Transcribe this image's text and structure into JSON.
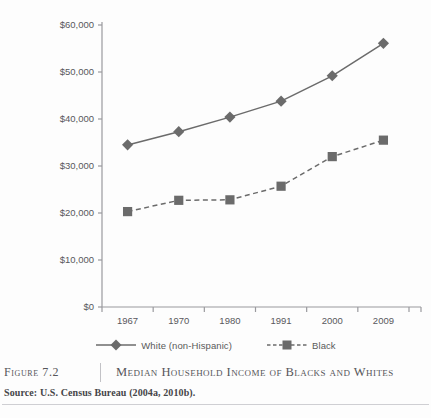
{
  "figure": {
    "number_label": "Figure 7.2",
    "title": "Median Household Income of Blacks and Whites",
    "source": "Source: U.S. Census Bureau (2004a, 2010b)."
  },
  "colors": {
    "series_gray": "#6b6b6b",
    "axis_gray": "#9a9a9e",
    "text_gray": "#58585c",
    "rule_gray": "#cfcfd3",
    "background": "#fdfdfd"
  },
  "legend": {
    "position": "bottom",
    "entries": [
      {
        "label": "White (non-Hispanic)",
        "marker": "diamond",
        "line": "solid"
      },
      {
        "label": "Black",
        "marker": "square",
        "line": "dashed"
      }
    ]
  },
  "chart_data": {
    "type": "line",
    "title": "Median Household Income of Blacks and Whites",
    "xlabel": "",
    "ylabel": "",
    "x": [
      "1967",
      "1970",
      "1980",
      "1991",
      "2000",
      "2009"
    ],
    "categories": [
      "1967",
      "1970",
      "1980",
      "1991",
      "2000",
      "2009"
    ],
    "ylim": [
      0,
      60000
    ],
    "yticks": [
      0,
      10000,
      20000,
      30000,
      40000,
      50000,
      60000
    ],
    "ytick_labels": [
      "$0",
      "$10,000",
      "$20,000",
      "$30,000",
      "$40,000",
      "$50,000",
      "$60,000"
    ],
    "xtick_labels": [
      "1967",
      "1970",
      "1980",
      "1991",
      "2000",
      "2009"
    ],
    "grid": false,
    "legend_position": "bottom",
    "series": [
      {
        "name": "White (non-Hispanic)",
        "marker": "diamond",
        "line": "solid",
        "values": [
          34500,
          37300,
          40400,
          43800,
          49200,
          56100
        ]
      },
      {
        "name": "Black",
        "marker": "square",
        "line": "dashed",
        "values": [
          20300,
          22700,
          22800,
          25700,
          32000,
          35500
        ]
      }
    ]
  }
}
